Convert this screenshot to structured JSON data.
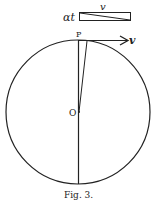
{
  "figure": {
    "caption": "Fig. 3.",
    "labels": {
      "top_bar_left": "αt",
      "top_bar_above": "v",
      "point_top": "P",
      "center": "O",
      "arrow": "v"
    },
    "colors": {
      "ink": "#222222",
      "background": "#ffffff"
    }
  }
}
